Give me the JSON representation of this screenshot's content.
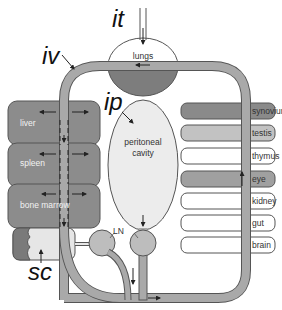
{
  "diagram": {
    "route_labels": {
      "it": "it",
      "iv": "iv",
      "ip": "ip",
      "sc": "sc"
    },
    "center": {
      "lungs": "lungs",
      "peritoneal_line1": "peritoneal",
      "peritoneal_line2": "cavity",
      "lymph_node": "LN"
    },
    "left_organs": [
      {
        "label": "liver",
        "fill": "#8c8c8c"
      },
      {
        "label": "spleen",
        "fill": "#8c8c8c"
      },
      {
        "label": "bone marrow",
        "fill": "#8c8c8c"
      }
    ],
    "subcutaneous": {
      "dark_fill": "#7a7a7a",
      "light_fill": "#e6e6e6"
    },
    "right_organs": [
      {
        "label": "synovium",
        "fill": "#8a8a8a"
      },
      {
        "label": "testis",
        "fill": "#c2c2c2"
      },
      {
        "label": "thymus",
        "fill": "#ffffff"
      },
      {
        "label": "eye",
        "fill": "#a0a0a0"
      },
      {
        "label": "kidney",
        "fill": "#ffffff"
      },
      {
        "label": "gut",
        "fill": "#ffffff"
      },
      {
        "label": "brain",
        "fill": "#ffffff"
      }
    ],
    "colors": {
      "vessel": "#a9a9a9",
      "outline": "#555555",
      "lungs_bottom": "#7d7d7d",
      "peritoneal": "#ececec",
      "ln": "#bdbdbd"
    }
  }
}
